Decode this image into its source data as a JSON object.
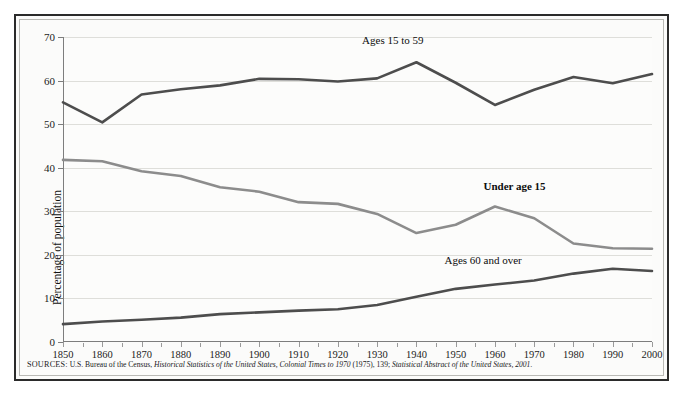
{
  "figure": {
    "caption_remnant": "",
    "source_prefix": "SOURCES:",
    "source_text_1": " U.S. Bureau of the Census, ",
    "source_italic_1": "Historical Statistics of the United States, Colonial Times to 1970",
    "source_text_2": " (1975), 139; ",
    "source_italic_2": "Statistical Abstract of the United States, 2001.",
    "border_color": "#2b2b2b",
    "background_color": "#fbfbfa"
  },
  "chart_data": {
    "type": "line",
    "title": "",
    "xlabel": "",
    "ylabel": "Percentage of population",
    "xlim": [
      1850,
      2000
    ],
    "ylim": [
      0,
      70
    ],
    "ytick_step": 10,
    "grid": true,
    "legend_position": "inline-annotations",
    "categories": [
      1850,
      1860,
      1870,
      1880,
      1890,
      1900,
      1910,
      1920,
      1930,
      1940,
      1950,
      1960,
      1970,
      1980,
      1990,
      2000
    ],
    "xticklabels": [
      "1850",
      "1860",
      "1870",
      "1880",
      "1890",
      "1900",
      "1910",
      "1920",
      "1930",
      "1940",
      "1950",
      "1960",
      "1970",
      "1980",
      "1990",
      "2000"
    ],
    "yticklabels": [
      "0",
      "10",
      "20",
      "30",
      "40",
      "50",
      "60",
      "70"
    ],
    "yticks": [
      0,
      10,
      20,
      30,
      40,
      50,
      60,
      70
    ],
    "series": [
      {
        "name": "Ages 15 to 59",
        "color": "#4d4d4d",
        "width": 2.6,
        "label_x": 1934,
        "label_y": 69.0,
        "bold": false,
        "values": [
          55.0,
          50.4,
          56.8,
          58.0,
          58.9,
          60.4,
          60.3,
          59.8,
          60.5,
          64.2,
          59.5,
          54.4,
          57.9,
          60.8,
          59.4,
          61.5
        ]
      },
      {
        "name": "Under age 15",
        "color": "#8c8c8c",
        "width": 2.6,
        "label_x": 1965,
        "label_y": 35.5,
        "bold": true,
        "values": [
          41.8,
          41.5,
          39.2,
          38.1,
          35.5,
          34.5,
          32.1,
          31.7,
          29.4,
          25.0,
          26.9,
          31.1,
          28.4,
          22.6,
          21.5,
          21.4
        ]
      },
      {
        "name": "Ages 60 and over",
        "color": "#4d4d4d",
        "width": 2.6,
        "label_x": 1957,
        "label_y": 18.7,
        "bold": false,
        "values": [
          4.1,
          4.7,
          5.1,
          5.6,
          6.4,
          6.8,
          7.2,
          7.5,
          8.5,
          10.4,
          12.2,
          13.2,
          14.1,
          15.7,
          16.8,
          16.3
        ]
      }
    ]
  }
}
